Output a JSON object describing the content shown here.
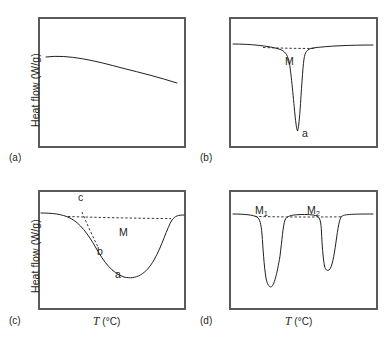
{
  "figure": {
    "axis": {
      "y_label": "Heat flow (W/g)",
      "x_symbol": "T",
      "x_unit": "(°C)"
    },
    "stroke_color": "#231f20",
    "frame_color": "#595a5c"
  },
  "panels": [
    {
      "id": "a",
      "letter": "(a)",
      "has_y_label": true,
      "has_x_label": false,
      "annotations": [],
      "curves": {
        "main": "M 8,40 C 30,37 58,44 84,51 C 104,56 120,60 139,66",
        "baseline": "",
        "tangent": ""
      }
    },
    {
      "id": "b",
      "letter": "(b)",
      "has_y_label": false,
      "has_x_label": false,
      "annotations": [
        {
          "name": "peak-label-M",
          "text": "M"
        },
        {
          "name": "onset-label-a",
          "text": "a"
        }
      ],
      "curves": {
        "main": "M 4,27 C 22,27 40,29 50,32 C 56,34 58,37 60,44 C 62,54 64,78 66,98 C 66.8,106 67.6,112 68.5,114 C 69.4,112 70.2,104 71,94 C 72.4,74 73.6,52 75,42 C 76,35 78,32 84,31 C 98,29 122,28 144,28",
        "baseline": "M 34,30.5 C 54,31.2 70,31.6 86,31.4",
        "tangent": ""
      }
    },
    {
      "id": "c",
      "letter": "(c)",
      "has_y_label": true,
      "has_x_label": true,
      "annotations": [
        {
          "name": "baseline-label-c",
          "text": "c"
        },
        {
          "name": "area-label-M",
          "text": "M"
        },
        {
          "name": "onset-label-b",
          "text": "b"
        },
        {
          "name": "peak-label-a",
          "text": "a"
        }
      ],
      "curves": {
        "main": "M 3,23 C 14,23 24,24 32,28 C 42,33 50,44 58,58 C 66,72 74,83 86,87 C 98,90 108,84 116,70 C 124,56 129,38 134,30 C 137,26 140,25 146,25",
        "baseline": "M 30,26.5 C 60,27.5 100,28.3 133,28.6",
        "tangent": "M 44,22 C 48,32 54,45 60,57"
      }
    },
    {
      "id": "d",
      "letter": "(d)",
      "has_y_label": false,
      "has_x_label": true,
      "annotations": [
        {
          "name": "peak-label-M1",
          "text": "M",
          "sub": "1"
        },
        {
          "name": "peak-label-M2",
          "text": "M",
          "sub": "2"
        }
      ],
      "curves": {
        "main": "M 4,24 C 16,24 24,25 28,27 C 31,29 32,34 33,44 C 34,58 35,76 37,88 C 38,94 40,97 42,97 C 45,96 48,84 51,66 C 53,50 54,36 56,30 C 58,26 62,25 70,24.6 C 78,24.3 84,24.6 88,26 C 91,27.4 92,32 92.5,42 C 93,54 94,68 95.5,76 C 96.5,80 98,81 100,80 C 103,78 105,66 107,52 C 109,38 110,29 113,26 C 116,24.3 124,24 144,24",
        "baseline": "M 26,26.4 C 50,27 80,27.2 112,26.8",
        "tangent": ""
      }
    }
  ]
}
